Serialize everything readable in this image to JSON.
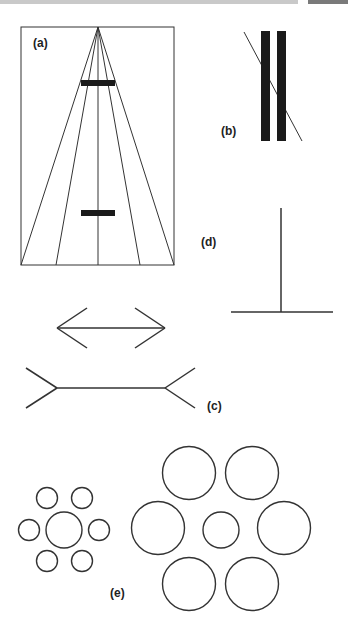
{
  "figure": {
    "panels": [
      {
        "id": "a",
        "label": "(a)",
        "name": "Ponzo illusion"
      },
      {
        "id": "b",
        "label": "(b)",
        "name": "Poggendorff illusion"
      },
      {
        "id": "c",
        "label": "(c)",
        "name": "Muller-Lyer illusion"
      },
      {
        "id": "d",
        "label": "(d)",
        "name": "Vertical-horizontal illusion"
      },
      {
        "id": "e",
        "label": "(e)",
        "name": "Ebbinghaus illusion"
      }
    ],
    "colors": {
      "stroke": "#333333",
      "fill": "#1a1a1a",
      "header": "#c9c9c9",
      "header_tab": "#7a7a7a"
    }
  }
}
